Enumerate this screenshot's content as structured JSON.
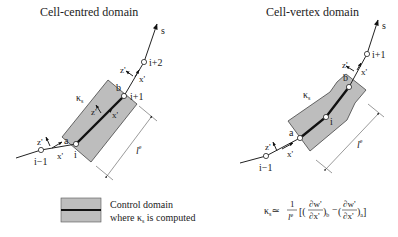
{
  "left_panel": {
    "title": "Cell-centred domain",
    "axis_label": "s",
    "nodes": [
      "i−1",
      "i",
      "i+1",
      "i+2"
    ],
    "points": [
      "a",
      "b"
    ],
    "curvature_label": "κ",
    "curvature_sub": "s",
    "local_axes": {
      "x": "x'",
      "z": "z'"
    },
    "length_label": "l",
    "length_sup": "e"
  },
  "right_panel": {
    "title": "Cell-vertex domain",
    "axis_label": "s",
    "nodes": [
      "i−1",
      "i",
      "i+1"
    ],
    "points": [
      "a",
      "b"
    ],
    "curvature_label": "κ",
    "curvature_sub": "s",
    "local_axes": {
      "x": "x'",
      "z": "z'"
    },
    "length_label": "l",
    "length_sup": "e"
  },
  "legend": {
    "line1": "Control domain",
    "line2_pre": "where κ",
    "line2_sub": "s",
    "line2_post": " is computed"
  },
  "formula": {
    "lhs": "κ",
    "lhs_sub": "s",
    "approx": "≃",
    "frac_num": "1",
    "frac_den": "l",
    "frac_den_sup": "e",
    "term_b": "(∂w'/∂x')",
    "term_b_sub": "b",
    "minus": "−",
    "term_a": "(∂w'/∂x')",
    "term_a_sub": "a",
    "d_num": "∂w'",
    "d_den": "∂x'"
  },
  "colors": {
    "domain_fill": "#bdbdbd",
    "line": "#111111"
  }
}
